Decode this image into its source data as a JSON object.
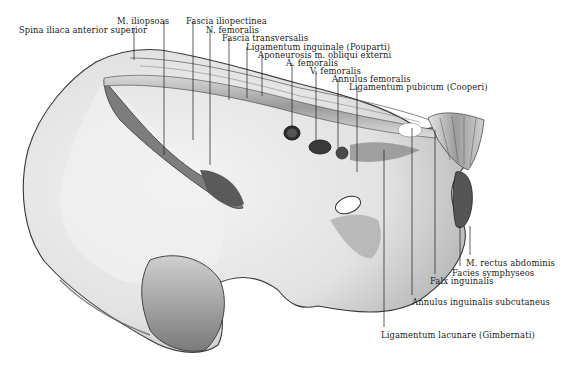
{
  "figure": {
    "type": "anatomical-illustration",
    "colors": {
      "ink": "#1a1a1a",
      "bone_light": "#ececec",
      "bone_mid": "#c8c8c8",
      "bone_dark": "#6e6e6e",
      "background": "#ffffff"
    }
  },
  "labels": [
    {
      "id": "spina-iliaca",
      "text": "Spina iliaca anterior superior",
      "x": 19,
      "y": 26
    },
    {
      "id": "m-iliopsoas",
      "text": "M. iliopsoas",
      "x": 117,
      "y": 17
    },
    {
      "id": "fascia-iliopectinea",
      "text": "Fascia iliopectinea",
      "x": 186,
      "y": 17
    },
    {
      "id": "n-femoralis",
      "text": "N. femoralis",
      "x": 206,
      "y": 26
    },
    {
      "id": "fascia-transversalis",
      "text": "Fascia transversalis",
      "x": 222,
      "y": 35
    },
    {
      "id": "lig-inguinale",
      "text": "Ligamentum inguinale (Pouparti)",
      "x": 246,
      "y": 43
    },
    {
      "id": "aponeurosis",
      "text": "Aponeurosis m. obliqui externi",
      "x": 258,
      "y": 51
    },
    {
      "id": "a-femoralis",
      "text": "A. femoralis",
      "x": 286,
      "y": 59
    },
    {
      "id": "v-femoralis",
      "text": "V. femoralis",
      "x": 310,
      "y": 67
    },
    {
      "id": "annulus-femoralis",
      "text": "Annulus femoralis",
      "x": 332,
      "y": 75
    },
    {
      "id": "lig-pubicum",
      "text": "Ligamentum pubicum (Cooperi)",
      "x": 349,
      "y": 83
    },
    {
      "id": "m-rectus",
      "text": "M. rectus abdominis",
      "x": 466,
      "y": 259
    },
    {
      "id": "facies-symphyseos",
      "text": "Facies symphyseos",
      "x": 452,
      "y": 270
    },
    {
      "id": "falx-inguinalis",
      "text": "Falx inguinalis",
      "x": 430,
      "y": 278
    },
    {
      "id": "annulus-inguinalis",
      "text": "Annulus inguinalis subcutaneus",
      "x": 412,
      "y": 299
    },
    {
      "id": "lig-lacunare",
      "text": "Ligamentum lacunare (Gimbernati)",
      "x": 381,
      "y": 331
    }
  ],
  "leaders": [
    {
      "id": "spina-iliaca",
      "x1": 134,
      "y1": 29,
      "x2": 134,
      "y2": 60
    },
    {
      "id": "m-iliopsoas",
      "x1": 164,
      "y1": 21,
      "x2": 164,
      "y2": 155
    },
    {
      "id": "fascia-iliopectinea",
      "x1": 193,
      "y1": 21,
      "x2": 193,
      "y2": 140
    },
    {
      "id": "n-femoralis",
      "x1": 210,
      "y1": 30,
      "x2": 210,
      "y2": 165
    },
    {
      "id": "fascia-transversalis",
      "x1": 229,
      "y1": 38,
      "x2": 229,
      "y2": 100
    },
    {
      "id": "lig-inguinale",
      "x1": 247,
      "y1": 47,
      "x2": 247,
      "y2": 98
    },
    {
      "id": "aponeurosis",
      "x1": 262,
      "y1": 55,
      "x2": 262,
      "y2": 96
    },
    {
      "id": "a-femoralis",
      "x1": 292,
      "y1": 63,
      "x2": 292,
      "y2": 128
    },
    {
      "id": "v-femoralis",
      "x1": 316,
      "y1": 71,
      "x2": 316,
      "y2": 140
    },
    {
      "id": "annulus-femoralis",
      "x1": 338,
      "y1": 79,
      "x2": 338,
      "y2": 148
    },
    {
      "id": "lig-pubicum",
      "x1": 357,
      "y1": 87,
      "x2": 357,
      "y2": 172
    },
    {
      "id": "m-rectus",
      "x1": 470,
      "y1": 226,
      "x2": 470,
      "y2": 255
    },
    {
      "id": "facies-symphyseos",
      "x1": 460,
      "y1": 226,
      "x2": 460,
      "y2": 266
    },
    {
      "id": "falx-inguinalis",
      "x1": 435,
      "y1": 130,
      "x2": 435,
      "y2": 274
    },
    {
      "id": "annulus-inguinalis",
      "x1": 412,
      "y1": 128,
      "x2": 412,
      "y2": 295
    },
    {
      "id": "lig-lacunare",
      "x1": 384,
      "y1": 150,
      "x2": 384,
      "y2": 327
    }
  ]
}
